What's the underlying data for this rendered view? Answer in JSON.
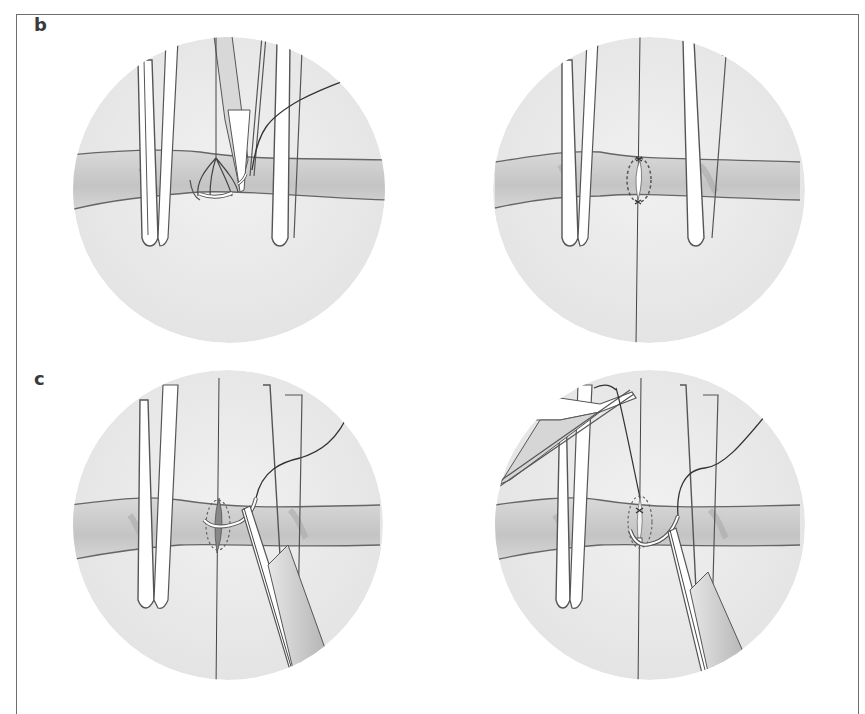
{
  "figure": {
    "panels": [
      {
        "label": "b",
        "row": 1,
        "images": [
          {
            "id": "b-left",
            "description": "Vessel held between two clamp blades; needle with suture passing through lumen, forceps tip holding needle"
          },
          {
            "id": "b-right",
            "description": "Vessel between clamp blades with stay sutures above and below, dotted elliptical suture path around incision"
          }
        ]
      },
      {
        "label": "c",
        "row": 2,
        "images": [
          {
            "id": "c-left",
            "description": "Curved needle in forceps passing through vessel wall beside incision, suture thread trailing up-right"
          },
          {
            "id": "c-right",
            "description": "Second forceps upper-left pulling suture thread, needle-holder lower right passing curved needle"
          }
        ]
      }
    ],
    "colors": {
      "background": "#ffffff",
      "frame_border": "#6e6e6e",
      "field_circle": "#ebebeb",
      "vessel_fill": "#cfcfcf",
      "vessel_dark": "#b5b5b5",
      "outline": "#555555",
      "instrument_fill": "#ffffff",
      "label_text": "#3a3a3a"
    }
  }
}
